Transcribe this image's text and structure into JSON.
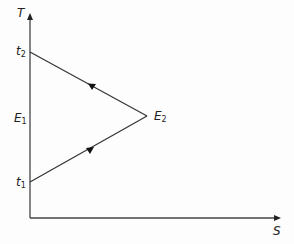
{
  "diagram": {
    "axes": {
      "y_label": "T",
      "x_label": "S"
    },
    "points": {
      "t2": {
        "label": "t",
        "sub": "2"
      },
      "E1": {
        "label": "E",
        "sub": "1"
      },
      "t1": {
        "label": "t",
        "sub": "1"
      },
      "E2": {
        "label": "E",
        "sub": "2"
      }
    },
    "colors": {
      "line": "#333333",
      "background": "#fdfdfd"
    }
  }
}
